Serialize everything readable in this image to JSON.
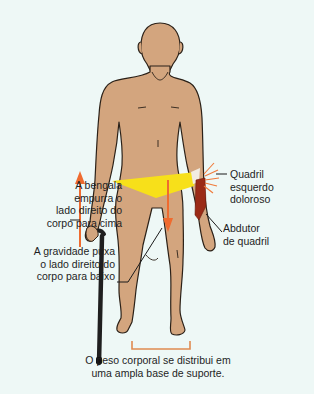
{
  "diagram": {
    "title": "",
    "labels": {
      "cane_pushes": "A bengala\nempurra o\nlado direito do\ncorpo para cima",
      "gravity_pulls": "A gravidade puxa\no lado direito do\ncorpo para baixo",
      "painful_hip": "Quadril\nesquerdo\ndoloroso",
      "hip_abductor": "Abdutor\nde quadril",
      "support_base": "O peso corporal se distribui em\numa ampla base de suporte."
    },
    "colors": {
      "background": "#eef8f6",
      "skin": "#d3a57e",
      "outline": "#2b2118",
      "cane": "#1f1f1f",
      "arrow": "#ef6b2f",
      "pelvis_highlight": "#f7e01a",
      "abductor_muscle": "#9b2b17",
      "pain_rays": "#f07a3a",
      "bracket": "#e08a50"
    }
  }
}
